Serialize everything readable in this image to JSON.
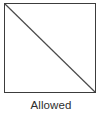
{
  "figure": {
    "name": "allowed-shape-diagram",
    "caption": "Allowed",
    "shape": {
      "type": "square",
      "label": "square-outline",
      "diagonal": "top-left-to-bottom-right",
      "fill": "#ffffff",
      "stroke": "#3c3c3c",
      "stroke_width_px": 1.5
    },
    "colors": {
      "background": "#ffffff",
      "outline": "#3c3c3c",
      "diagonal_line": "#4a4a4a",
      "caption_text": "#2e2e2e"
    }
  }
}
